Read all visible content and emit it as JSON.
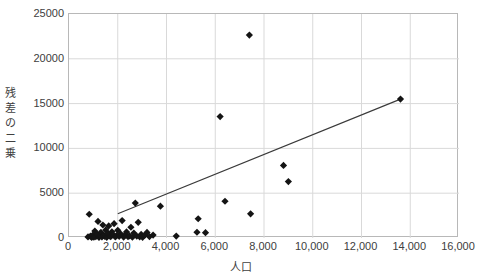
{
  "chart_data": {
    "type": "scatter",
    "title": "",
    "xlabel": "人口",
    "ylabel": "残差の二乗",
    "xlim": [
      0,
      16000
    ],
    "ylim": [
      0,
      25000
    ],
    "xticks": [
      0,
      2000,
      4000,
      6000,
      8000,
      10000,
      12000,
      14000,
      16000
    ],
    "xticklabels": [
      "0",
      "2,000",
      "4,000",
      "6,000",
      "8,000",
      "10,000",
      "12,000",
      "14,000",
      "16,000"
    ],
    "yticks": [
      0,
      5000,
      10000,
      15000,
      20000,
      25000
    ],
    "yticklabels": [
      "0",
      "5000",
      "10000",
      "15000",
      "20000",
      "25000"
    ],
    "grid": true,
    "legend": false,
    "marker": "diamond",
    "marker_color": "#141414",
    "points": [
      [
        780,
        120
      ],
      [
        830,
        2650
      ],
      [
        880,
        200
      ],
      [
        930,
        60
      ],
      [
        980,
        330
      ],
      [
        1020,
        90
      ],
      [
        1060,
        780
      ],
      [
        1100,
        160
      ],
      [
        1150,
        420
      ],
      [
        1190,
        1850
      ],
      [
        1230,
        70
      ],
      [
        1270,
        250
      ],
      [
        1310,
        640
      ],
      [
        1350,
        110
      ],
      [
        1390,
        1450
      ],
      [
        1430,
        300
      ],
      [
        1470,
        180
      ],
      [
        1510,
        900
      ],
      [
        1550,
        80
      ],
      [
        1590,
        520
      ],
      [
        1630,
        1350
      ],
      [
        1670,
        230
      ],
      [
        1710,
        140
      ],
      [
        1760,
        700
      ],
      [
        1800,
        380
      ],
      [
        1850,
        1600
      ],
      [
        1900,
        120
      ],
      [
        1950,
        260
      ],
      [
        2000,
        860
      ],
      [
        2060,
        190
      ],
      [
        2120,
        450
      ],
      [
        2180,
        1950
      ],
      [
        2240,
        100
      ],
      [
        2300,
        320
      ],
      [
        2360,
        680
      ],
      [
        2420,
        150
      ],
      [
        2480,
        240
      ],
      [
        2540,
        1200
      ],
      [
        2600,
        90
      ],
      [
        2660,
        560
      ],
      [
        2720,
        3900
      ],
      [
        2780,
        210
      ],
      [
        2840,
        1750
      ],
      [
        2900,
        130
      ],
      [
        2960,
        400
      ],
      [
        3020,
        70
      ],
      [
        3100,
        290
      ],
      [
        3200,
        620
      ],
      [
        3300,
        160
      ],
      [
        3450,
        330
      ],
      [
        3750,
        3550
      ],
      [
        4400,
        210
      ],
      [
        5300,
        2150
      ],
      [
        5250,
        640
      ],
      [
        5600,
        590
      ],
      [
        6200,
        13550
      ],
      [
        6400,
        4100
      ],
      [
        7400,
        22650
      ],
      [
        7450,
        2700
      ],
      [
        8800,
        8100
      ],
      [
        9000,
        6300
      ],
      [
        13600,
        15500
      ]
    ],
    "trendline": {
      "x0": 2000,
      "y0": 2700,
      "x1": 13600,
      "y1": 15500
    }
  }
}
